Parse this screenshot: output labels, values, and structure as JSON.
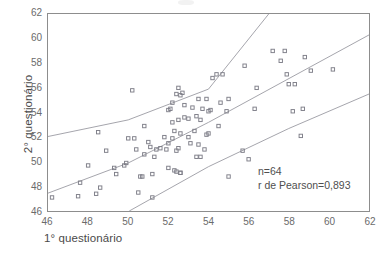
{
  "chart_data": {
    "type": "scatter",
    "title": "",
    "xlabel": "1° questionário",
    "ylabel": "2° questionário",
    "xlim": [
      46,
      62
    ],
    "ylim": [
      46,
      62
    ],
    "xticks": [
      46,
      48,
      50,
      52,
      54,
      56,
      58,
      60,
      62
    ],
    "yticks": [
      46,
      48,
      50,
      52,
      54,
      56,
      58,
      60,
      62
    ],
    "grid": false,
    "legend": false,
    "marker": "open-square",
    "marker_color": "#7d7d87",
    "line_color": "#9a9aa2",
    "axis_color": "#8d8d8d",
    "annotations": [
      {
        "text": "n=64",
        "x": 56.2,
        "y": 49.2
      },
      {
        "text": "r de Pearson=0,893",
        "x": 56.2,
        "y": 48.2
      }
    ],
    "series": [
      {
        "name": "pontos",
        "type": "scatter",
        "points": [
          [
            46.2,
            47.1
          ],
          [
            47.5,
            47.2
          ],
          [
            47.6,
            48.3
          ],
          [
            48.0,
            49.7
          ],
          [
            48.4,
            47.4
          ],
          [
            48.5,
            52.4
          ],
          [
            48.6,
            47.9
          ],
          [
            48.9,
            50.9
          ],
          [
            49.3,
            49.5
          ],
          [
            49.4,
            49.0
          ],
          [
            49.8,
            49.7
          ],
          [
            49.9,
            49.9
          ],
          [
            50.0,
            51.9
          ],
          [
            50.2,
            55.8
          ],
          [
            50.3,
            51.9
          ],
          [
            50.4,
            51.0
          ],
          [
            50.5,
            47.5
          ],
          [
            50.6,
            48.8
          ],
          [
            50.7,
            48.8
          ],
          [
            50.8,
            50.6
          ],
          [
            50.8,
            52.9
          ],
          [
            51.0,
            51.6
          ],
          [
            51.1,
            51.2
          ],
          [
            51.2,
            47.1
          ],
          [
            51.2,
            49.0
          ],
          [
            51.3,
            50.4
          ],
          [
            51.4,
            51.0
          ],
          [
            51.6,
            51.1
          ],
          [
            51.8,
            52.0
          ],
          [
            51.9,
            51.0
          ],
          [
            52.0,
            49.5
          ],
          [
            52.0,
            51.5
          ],
          [
            52.0,
            54.2
          ],
          [
            52.1,
            54.3
          ],
          [
            52.2,
            51.9
          ],
          [
            52.2,
            53.2
          ],
          [
            52.2,
            54.8
          ],
          [
            52.3,
            49.3
          ],
          [
            52.3,
            52.5
          ],
          [
            52.4,
            49.2
          ],
          [
            52.4,
            50.9
          ],
          [
            52.4,
            55.5
          ],
          [
            52.5,
            51.1
          ],
          [
            52.5,
            53.4
          ],
          [
            52.5,
            56.0
          ],
          [
            52.6,
            49.1
          ],
          [
            52.6,
            49.1
          ],
          [
            52.6,
            52.3
          ],
          [
            52.6,
            55.4
          ],
          [
            52.7,
            55.6
          ],
          [
            52.8,
            53.6
          ],
          [
            52.8,
            54.6
          ],
          [
            53.0,
            52.0
          ],
          [
            53.0,
            53.5
          ],
          [
            53.1,
            51.5
          ],
          [
            53.2,
            54.4
          ],
          [
            53.3,
            52.5
          ],
          [
            53.4,
            50.4
          ],
          [
            53.4,
            53.7
          ],
          [
            53.5,
            51.4
          ],
          [
            53.5,
            55.1
          ],
          [
            53.6,
            50.4
          ],
          [
            53.6,
            53.4
          ],
          [
            53.7,
            54.3
          ],
          [
            53.8,
            51.0
          ],
          [
            53.9,
            52.2
          ],
          [
            53.9,
            55.1
          ],
          [
            54.0,
            52.3
          ],
          [
            54.0,
            54.1
          ],
          [
            54.1,
            54.2
          ],
          [
            54.2,
            56.8
          ],
          [
            54.4,
            57.1
          ],
          [
            54.5,
            52.9
          ],
          [
            54.6,
            54.8
          ],
          [
            54.7,
            57.1
          ],
          [
            54.9,
            54.1
          ],
          [
            55.0,
            48.8
          ],
          [
            55.0,
            55.1
          ],
          [
            55.7,
            50.9
          ],
          [
            55.8,
            57.8
          ],
          [
            56.0,
            50.2
          ],
          [
            56.3,
            54.3
          ],
          [
            56.4,
            56.0
          ],
          [
            57.2,
            59.0
          ],
          [
            57.6,
            58.2
          ],
          [
            57.8,
            59.0
          ],
          [
            57.9,
            57.1
          ],
          [
            58.0,
            56.3
          ],
          [
            58.2,
            54.1
          ],
          [
            58.3,
            56.3
          ],
          [
            58.6,
            52.1
          ],
          [
            58.7,
            54.3
          ],
          [
            58.8,
            58.5
          ],
          [
            59.1,
            57.4
          ],
          [
            60.2,
            57.5
          ]
        ]
      }
    ],
    "lines": [
      {
        "name": "limite-superior",
        "points": [
          [
            46,
            52.05
          ],
          [
            50,
            53.4
          ],
          [
            54,
            55.9
          ],
          [
            57.0,
            62.0
          ]
        ]
      },
      {
        "name": "linha-de-regressao",
        "points": [
          [
            46,
            47.45
          ],
          [
            50,
            49.9
          ],
          [
            54,
            53.2
          ],
          [
            62,
            60.3
          ]
        ]
      },
      {
        "name": "limite-inferior",
        "points": [
          [
            50.05,
            46.0
          ],
          [
            54,
            49.6
          ],
          [
            58,
            52.7
          ],
          [
            62,
            55.5
          ]
        ]
      }
    ]
  },
  "annotation": {
    "n_label": "n=64",
    "r_label": "r de Pearson=0,893"
  }
}
